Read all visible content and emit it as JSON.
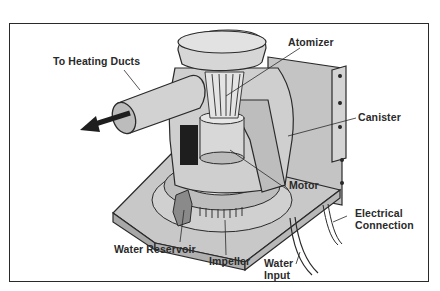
{
  "figure": {
    "type": "cutaway illustration"
  },
  "labels": {
    "heating_ducts": "To Heating Ducts",
    "atomizer": "Atomizer",
    "canister": "Canister",
    "motor": "Motor",
    "electrical_1": "Electrical",
    "electrical_2": "Connection",
    "water_reservoir": "Water Reservoir",
    "impeller": "Impeller",
    "water_input_1": "Water",
    "water_input_2": "Input"
  },
  "colors": {
    "frame": "#2a2a2a",
    "body_fill": "#c9c9c9",
    "body_light": "#dcdcdc",
    "body_dark": "#9a9a9a",
    "ink": "#2a2a2a"
  }
}
